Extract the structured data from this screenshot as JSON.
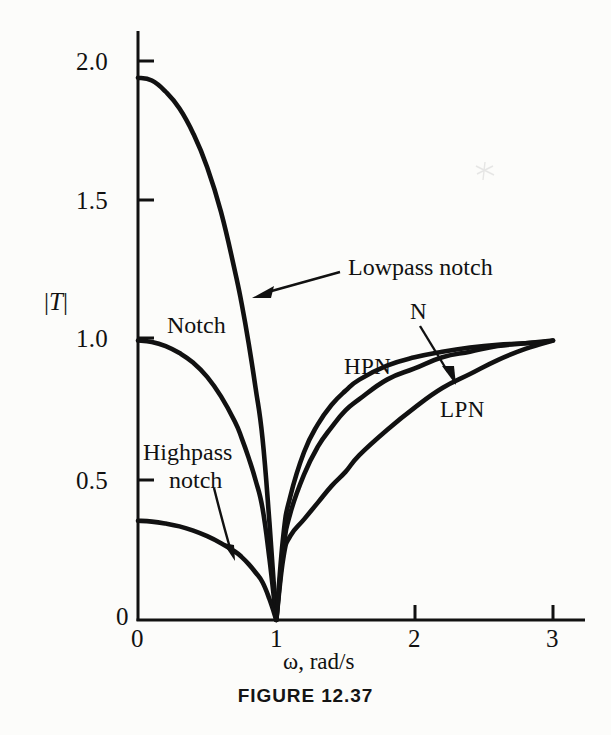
{
  "figure": {
    "caption": "FIGURE 12.37",
    "background_color": "#fcfcfa",
    "ink_color": "#111111"
  },
  "axes": {
    "y_axis_title": "|T|",
    "x_axis_title": "ω, rad/s",
    "x_ticks": [
      "0",
      "1",
      "2",
      "3"
    ],
    "y_ticks": [
      "0",
      "0.5",
      "1.0",
      "1.5",
      "2.0"
    ],
    "x_tick_values": [
      0,
      1,
      2,
      3
    ],
    "y_tick_values": [
      0,
      0.5,
      1.0,
      1.5,
      2.0
    ]
  },
  "annotations": {
    "lowpass_notch": "Lowpass notch",
    "notch": "Notch",
    "highpass_line1": "Highpass",
    "highpass_line2": "notch",
    "n": "N",
    "hpn": "HPN",
    "lpn": "LPN"
  },
  "chart_data": {
    "type": "line",
    "title": "FIGURE 12.37",
    "xlabel": "ω, rad/s",
    "ylabel": "|T|",
    "xlim": [
      0,
      3.15
    ],
    "ylim": [
      0,
      2.12
    ],
    "grid": false,
    "legend": "inline-annotations",
    "x_ticks": [
      0,
      1,
      2,
      3
    ],
    "y_ticks": [
      0,
      0.5,
      1.0,
      1.5,
      2.0
    ],
    "notch_frequency": 1.0,
    "series": [
      {
        "name": "Lowpass notch",
        "short_name": "LPN",
        "label_positions": [
          "Lowpass notch",
          "LPN"
        ],
        "x": [
          0.0,
          0.1,
          0.2,
          0.3,
          0.4,
          0.5,
          0.6,
          0.7,
          0.75,
          0.8,
          0.85,
          0.9,
          0.95,
          1.0,
          1.05,
          1.1,
          1.2,
          1.3,
          1.4,
          1.5,
          1.6,
          1.8,
          2.0,
          2.2,
          2.4,
          2.6,
          2.8,
          3.0
        ],
        "y": [
          1.94,
          1.93,
          1.89,
          1.83,
          1.74,
          1.62,
          1.46,
          1.25,
          1.13,
          0.99,
          0.83,
          0.65,
          0.35,
          0.0,
          0.22,
          0.3,
          0.36,
          0.42,
          0.48,
          0.53,
          0.59,
          0.68,
          0.76,
          0.83,
          0.88,
          0.93,
          0.97,
          1.0
        ]
      },
      {
        "name": "Notch",
        "short_name": "N",
        "label_positions": [
          "Notch",
          "N"
        ],
        "x": [
          0.0,
          0.1,
          0.2,
          0.3,
          0.4,
          0.5,
          0.6,
          0.7,
          0.75,
          0.8,
          0.85,
          0.9,
          0.95,
          1.0,
          1.05,
          1.1,
          1.2,
          1.3,
          1.4,
          1.5,
          1.6,
          1.8,
          2.0,
          2.2,
          2.4,
          2.6,
          2.8,
          3.0
        ],
        "y": [
          1.0,
          0.995,
          0.98,
          0.955,
          0.92,
          0.87,
          0.8,
          0.71,
          0.65,
          0.58,
          0.5,
          0.4,
          0.22,
          0.0,
          0.25,
          0.38,
          0.52,
          0.62,
          0.69,
          0.75,
          0.79,
          0.86,
          0.9,
          0.94,
          0.96,
          0.98,
          0.99,
          1.0
        ]
      },
      {
        "name": "Highpass notch",
        "short_name": "HPN",
        "label_positions": [
          "Highpass notch",
          "HPN"
        ],
        "x": [
          0.0,
          0.1,
          0.2,
          0.3,
          0.4,
          0.5,
          0.6,
          0.7,
          0.75,
          0.8,
          0.85,
          0.9,
          0.95,
          1.0,
          1.05,
          1.1,
          1.2,
          1.3,
          1.4,
          1.5,
          1.6,
          1.8,
          2.0,
          2.2,
          2.4,
          2.6,
          2.8,
          2.95
        ],
        "y": [
          0.355,
          0.352,
          0.345,
          0.335,
          0.32,
          0.3,
          0.275,
          0.245,
          0.225,
          0.2,
          0.17,
          0.135,
          0.075,
          0.0,
          0.3,
          0.44,
          0.6,
          0.7,
          0.77,
          0.82,
          0.86,
          0.91,
          0.94,
          0.96,
          0.975,
          0.985,
          0.99,
          0.995
        ]
      }
    ]
  }
}
